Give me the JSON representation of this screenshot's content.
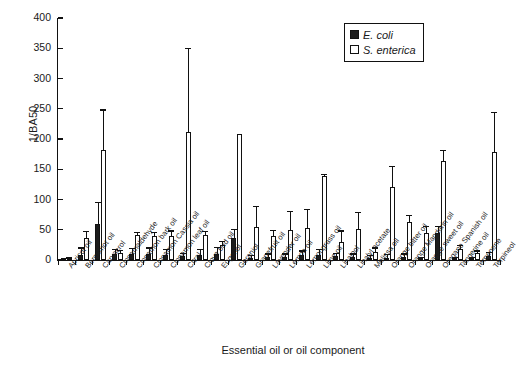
{
  "chart_data": {
    "type": "bar",
    "title": "",
    "xlabel": "Essential oil or oil component",
    "ylabel": "1/BA50",
    "ylim": [
      0,
      400
    ],
    "yticks": [
      0,
      50,
      100,
      150,
      200,
      250,
      300,
      350,
      400
    ],
    "grid": false,
    "legend_position": "top-right",
    "categories": [
      "Apricot oil",
      "Bergamot oil",
      "Carvacrol",
      "Cinnamaldehyde",
      "Cinnamon bark oil",
      "Cinnamon Cassia oil",
      "Cinnamon leaf oil",
      "Citral",
      "Clove bud oil",
      "Eugenol",
      "Geraniol",
      "Grapefruit oil",
      "Lavender oil",
      "Lemon oil",
      "Lemongrass oil",
      "Lime oil",
      "Linalool",
      "Linalyl acetate",
      "Melissa oil",
      "Orange bitter oil",
      "Orange Mandarin oil",
      "Orange sweet oil",
      "Oregano Spanish oil",
      "Tangerine oil",
      "Terpenene",
      "Terpineol"
    ],
    "series": [
      {
        "name": "E. coli",
        "color": "#1c1c1c",
        "values": [
          1,
          8,
          59,
          10,
          10,
          10,
          9,
          6,
          8,
          10,
          37,
          3,
          5,
          5,
          8,
          9,
          6,
          5,
          4,
          4,
          5,
          2,
          44,
          2,
          2,
          7
        ],
        "errors_upper": [
          2,
          19,
          94,
          17,
          18,
          19,
          17,
          10,
          17,
          20,
          49,
          6,
          9,
          9,
          14,
          17,
          10,
          9,
          7,
          8,
          9,
          4,
          55,
          4,
          4,
          12
        ]
      },
      {
        "name": "S. enterica",
        "color": "#ffffff",
        "values": [
          2,
          36,
          182,
          12,
          41,
          40,
          40,
          212,
          42,
          24,
          208,
          55,
          40,
          50,
          53,
          139,
          29,
          52,
          13,
          120,
          63,
          44,
          163,
          18,
          11,
          178
        ],
        "errors_upper": [
          4,
          46,
          247,
          15,
          44,
          44,
          47,
          348,
          46,
          30,
          208,
          87,
          48,
          80,
          82,
          141,
          47,
          78,
          19,
          153,
          73,
          54,
          180,
          23,
          14,
          243
        ]
      }
    ]
  },
  "legend": {
    "entries": [
      {
        "label": "E. coli",
        "swatch": "filled-square"
      },
      {
        "label": "S. enterica",
        "swatch": "open-square"
      }
    ]
  },
  "axis": {
    "y_title": "1/BA50",
    "x_title": "Essential oil or oil component"
  }
}
